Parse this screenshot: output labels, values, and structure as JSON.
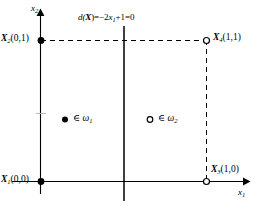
{
  "figure": {
    "type": "decision-boundary-diagram",
    "axes": {
      "x_label": "x",
      "x_sub": "1",
      "y_label": "x",
      "y_sub": "2"
    },
    "decision_function": {
      "text_full": "d(X)=−2x₁+1=0",
      "prefix": "d(",
      "var": "X",
      "mid": ")=−2",
      "x_sym": "x",
      "x_sub": "1",
      "suffix": "+1=0"
    },
    "points": [
      {
        "name": "X1",
        "sym": "X",
        "sub": "1",
        "coords": "(0,0)",
        "marker": "filled",
        "class": "omega1"
      },
      {
        "name": "X2",
        "sym": "X",
        "sub": "2",
        "coords": "(0,1)",
        "marker": "filled",
        "class": "omega1"
      },
      {
        "name": "X3",
        "sym": "X",
        "sub": "3",
        "coords": "(1,0)",
        "marker": "hollow",
        "class": "omega2"
      },
      {
        "name": "X4",
        "sym": "X",
        "sub": "4",
        "coords": "(1,1)",
        "marker": "hollow",
        "class": "omega2"
      }
    ],
    "legend": [
      {
        "marker": "filled",
        "relation": "∈",
        "class_sym": "ω",
        "class_sub": "1"
      },
      {
        "marker": "hollow",
        "relation": "∈",
        "class_sym": "ω",
        "class_sub": "2"
      }
    ],
    "colors": {
      "line": "#000000",
      "background": "#ffffff",
      "text": "#000000",
      "tick": "#999999"
    }
  }
}
